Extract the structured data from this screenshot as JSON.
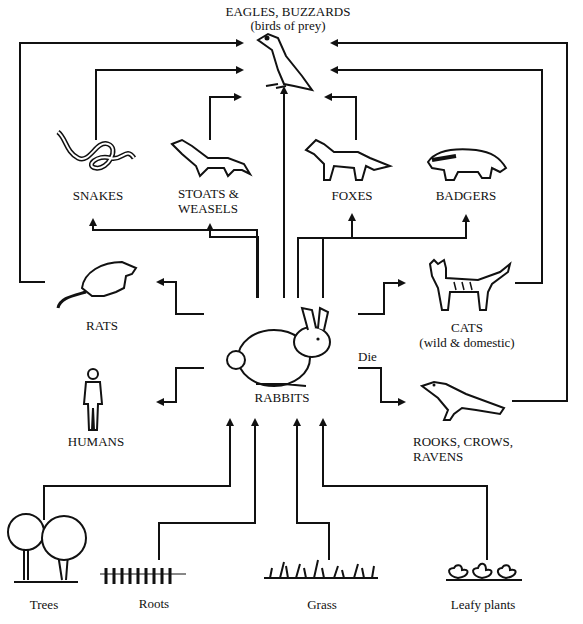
{
  "diagram": {
    "type": "food-web",
    "colors": {
      "ink": "#111111",
      "background": "#ffffff"
    },
    "nodes": {
      "eagles": {
        "label": "EAGLES, BUZZARDS",
        "sublabel": "(birds of prey)"
      },
      "snakes": {
        "label": "SNAKES"
      },
      "stoats": {
        "label": "STOATS &",
        "label2": "WEASELS"
      },
      "foxes": {
        "label": "FOXES"
      },
      "badgers": {
        "label": "BADGERS"
      },
      "rats": {
        "label": "RATS"
      },
      "rabbits": {
        "label": "RABBITS"
      },
      "cats": {
        "label": "CATS",
        "sublabel": "(wild & domestic)"
      },
      "humans": {
        "label": "HUMANS"
      },
      "rooks": {
        "label": "ROOKS, CROWS,",
        "label2": "RAVENS"
      },
      "trees": {
        "label": "Trees"
      },
      "roots": {
        "label": "Roots"
      },
      "grass": {
        "label": "Grass"
      },
      "leafy": {
        "label": "Leafy plants"
      }
    },
    "edge_labels": {
      "die": "Die"
    },
    "edges": [
      {
        "from": "Trees",
        "to": "Rabbits"
      },
      {
        "from": "Roots",
        "to": "Rabbits"
      },
      {
        "from": "Grass",
        "to": "Rabbits"
      },
      {
        "from": "Leafy plants",
        "to": "Rabbits"
      },
      {
        "from": "Rabbits",
        "to": "Snakes"
      },
      {
        "from": "Rabbits",
        "to": "Stoats & Weasels"
      },
      {
        "from": "Rabbits",
        "to": "Eagles, Buzzards"
      },
      {
        "from": "Rabbits",
        "to": "Foxes"
      },
      {
        "from": "Rabbits",
        "to": "Badgers"
      },
      {
        "from": "Rabbits",
        "to": "Rats"
      },
      {
        "from": "Rabbits",
        "to": "Cats"
      },
      {
        "from": "Rabbits",
        "to": "Humans"
      },
      {
        "from": "Rabbits",
        "to": "Rooks, Crows, Ravens",
        "label": "Die"
      },
      {
        "from": "Snakes",
        "to": "Eagles, Buzzards"
      },
      {
        "from": "Stoats & Weasels",
        "to": "Eagles, Buzzards"
      },
      {
        "from": "Foxes",
        "to": "Eagles, Buzzards"
      },
      {
        "from": "Rats",
        "to": "Eagles, Buzzards"
      },
      {
        "from": "Cats",
        "to": "Eagles, Buzzards"
      },
      {
        "from": "Rooks, Crows, Ravens",
        "to": "Eagles, Buzzards"
      }
    ]
  }
}
